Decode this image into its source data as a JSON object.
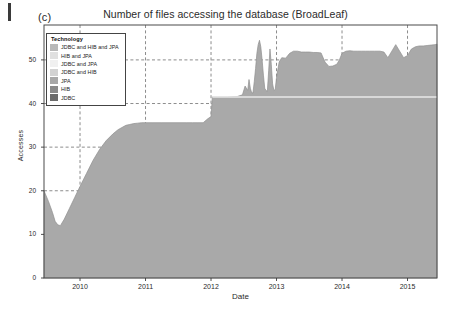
{
  "figure": {
    "panel_letter": "(c)",
    "title": "Number of files accessing the database (BroadLeaf)"
  },
  "legend": {
    "title": "Technology",
    "entries": [
      {
        "label": "JDBC and HIB and JPA",
        "color": "#b8b8b8"
      },
      {
        "label": "HIB and JPA",
        "color": "#e0e0e0"
      },
      {
        "label": "JDBC and JPA",
        "color": "#f0f0f0"
      },
      {
        "label": "JDBC and HIB",
        "color": "#d2d2d2"
      },
      {
        "label": "JPA",
        "color": "#a8a8a8"
      },
      {
        "label": "HIB",
        "color": "#8a8a8a"
      },
      {
        "label": "JDBC",
        "color": "#6b6b6b"
      }
    ]
  },
  "chart_data": {
    "type": "area",
    "title": "Number of files accessing the database (BroadLeaf)",
    "xlabel": "Date",
    "ylabel": "Accesses",
    "xlim": [
      2009.45,
      2015.45
    ],
    "ylim": [
      0,
      58
    ],
    "yticks": [
      0,
      10,
      20,
      30,
      40,
      50
    ],
    "xticks": [
      2010,
      2011,
      2012,
      2013,
      2014,
      2015
    ],
    "grid": "dashed",
    "legend_position": "upper-left-inside",
    "fill_color": "#a9a9a9",
    "line_color": "#8f8f8f",
    "band_color": "#e8e8e8",
    "band_value": 41.5,
    "band_start": 2012.02,
    "series": [
      {
        "name": "JDBC",
        "x": [
          2009.45,
          2009.52,
          2009.58,
          2009.62,
          2009.66,
          2009.7,
          2009.76,
          2009.84,
          2009.92,
          2010.0,
          2010.1,
          2010.2,
          2010.3,
          2010.4,
          2010.5,
          2010.58,
          2010.64,
          2010.7,
          2010.76,
          2010.82,
          2010.88,
          2010.94,
          2011.0,
          2011.1,
          2011.25,
          2011.45,
          2011.62,
          2011.72,
          2011.8,
          2011.88,
          2011.95,
          2012.0,
          2012.02,
          2012.1,
          2012.25,
          2012.4,
          2012.48,
          2012.52,
          2012.56,
          2012.58,
          2012.6,
          2012.62,
          2012.64,
          2012.66,
          2012.68,
          2012.7,
          2012.72,
          2012.74,
          2012.76,
          2012.78,
          2012.8,
          2012.82,
          2012.84,
          2012.86,
          2012.88,
          2012.9,
          2012.92,
          2012.94,
          2012.96,
          2012.98,
          2013.0,
          2013.04,
          2013.08,
          2013.14,
          2013.2,
          2013.26,
          2013.32,
          2013.38,
          2013.44,
          2013.5,
          2013.56,
          2013.62,
          2013.68,
          2013.74,
          2013.8,
          2013.86,
          2013.92,
          2013.96,
          2014.0,
          2014.06,
          2014.12,
          2014.18,
          2014.24,
          2014.3,
          2014.36,
          2014.42,
          2014.5,
          2014.58,
          2014.64,
          2014.7,
          2014.76,
          2014.82,
          2014.88,
          2014.94,
          2015.0,
          2015.06,
          2015.12,
          2015.18,
          2015.24,
          2015.3,
          2015.36,
          2015.42,
          2015.45
        ],
        "y": [
          20.0,
          17.5,
          15.0,
          13.0,
          12.2,
          12.0,
          13.5,
          16.0,
          18.5,
          21.0,
          24.0,
          27.0,
          29.5,
          31.5,
          33.0,
          34.0,
          34.5,
          35.0,
          35.2,
          35.4,
          35.5,
          35.6,
          35.6,
          35.6,
          35.6,
          35.6,
          35.6,
          35.6,
          35.6,
          35.6,
          36.5,
          37.0,
          41.5,
          41.5,
          41.5,
          41.6,
          42.0,
          44.0,
          43.0,
          45.5,
          43.5,
          42.5,
          42.4,
          45.0,
          48.0,
          51.5,
          53.5,
          54.5,
          53.0,
          50.0,
          46.5,
          43.5,
          43.0,
          42.8,
          47.5,
          52.5,
          49.0,
          44.5,
          43.0,
          43.2,
          46.0,
          49.5,
          50.5,
          50.4,
          51.5,
          52.0,
          52.0,
          51.8,
          51.8,
          51.8,
          51.7,
          51.7,
          51.6,
          49.5,
          48.5,
          48.6,
          49.0,
          50.0,
          51.5,
          52.0,
          52.1,
          52.0,
          52.0,
          52.0,
          52.0,
          52.0,
          52.0,
          52.0,
          51.8,
          50.5,
          52.0,
          53.5,
          52.0,
          50.5,
          51.0,
          52.5,
          53.0,
          53.2,
          53.2,
          53.3,
          53.4,
          53.5,
          53.6
        ]
      }
    ]
  }
}
